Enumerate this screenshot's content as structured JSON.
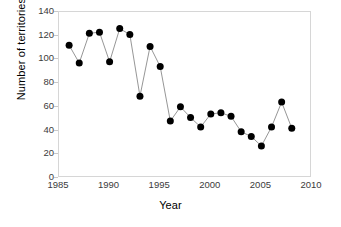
{
  "chart_data": {
    "type": "scatter",
    "title": "",
    "xlabel": "Year",
    "ylabel": "Number of territories",
    "xlim": [
      1985,
      2010
    ],
    "ylim": [
      0,
      140
    ],
    "xticks": [
      1985,
      1990,
      1995,
      2000,
      2005,
      2010
    ],
    "yticks": [
      0,
      20,
      40,
      60,
      80,
      100,
      120,
      140
    ],
    "grid": false,
    "legend": null,
    "marker": "filled-circle",
    "marker_color": "#000000",
    "line_color": "#8a8a8a",
    "x": [
      1986,
      1987,
      1988,
      1989,
      1990,
      1991,
      1992,
      1993,
      1994,
      1995,
      1996,
      1997,
      1998,
      1999,
      2000,
      2001,
      2002,
      2003,
      2004,
      2005,
      2006,
      2007,
      2008
    ],
    "values": [
      112,
      97,
      122,
      123,
      98,
      126,
      121,
      69,
      111,
      94,
      48,
      60,
      51,
      43,
      54,
      55,
      52,
      39,
      35,
      27,
      43,
      64,
      42
    ],
    "points": [
      {
        "year": 1986,
        "territories": 112
      },
      {
        "year": 1987,
        "territories": 97
      },
      {
        "year": 1988,
        "territories": 122
      },
      {
        "year": 1989,
        "territories": 123
      },
      {
        "year": 1990,
        "territories": 98
      },
      {
        "year": 1991,
        "territories": 126
      },
      {
        "year": 1992,
        "territories": 121
      },
      {
        "year": 1993,
        "territories": 69
      },
      {
        "year": 1994,
        "territories": 111
      },
      {
        "year": 1995,
        "territories": 94
      },
      {
        "year": 1996,
        "territories": 48
      },
      {
        "year": 1997,
        "territories": 60
      },
      {
        "year": 1998,
        "territories": 51
      },
      {
        "year": 1999,
        "territories": 43
      },
      {
        "year": 2000,
        "territories": 54
      },
      {
        "year": 2001,
        "territories": 55
      },
      {
        "year": 2002,
        "territories": 52
      },
      {
        "year": 2003,
        "territories": 39
      },
      {
        "year": 2004,
        "territories": 35
      },
      {
        "year": 2005,
        "territories": 27
      },
      {
        "year": 2006,
        "territories": 43
      },
      {
        "year": 2007,
        "territories": 64
      },
      {
        "year": 2008,
        "territories": 42
      }
    ]
  },
  "axes": {
    "y_label": "Number of territories",
    "x_label": "Year",
    "y_tick_labels": [
      "140",
      "120",
      "100",
      "80",
      "60",
      "40",
      "20",
      "0"
    ],
    "x_tick_labels": [
      "1985",
      "1990",
      "1995",
      "2000",
      "2005",
      "2010"
    ]
  },
  "colors": {
    "marker": "#000000",
    "line": "#8a8a8a",
    "frame": "#d6d6d6",
    "tick_text": "#3b3b3b",
    "axis_title": "#000000",
    "background": "#ffffff"
  }
}
